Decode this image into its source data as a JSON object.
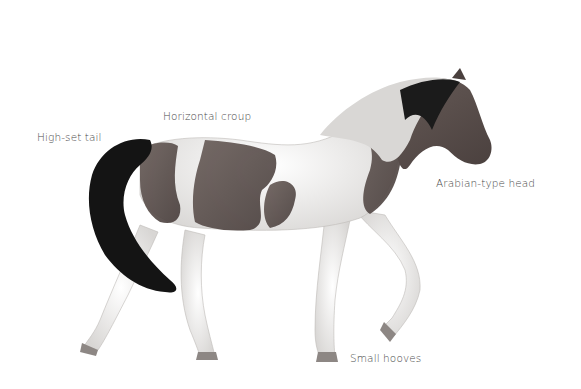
{
  "illustration": {
    "subject": "Pinto horse, side view, walking",
    "colors": {
      "dark_coat": "#5a4f4c",
      "white_coat": "#f2f2f0",
      "tail_mane": "#141414"
    }
  },
  "labels": {
    "tail": "High-set tail",
    "croup": "Horizontal croup",
    "head": "Arabian-type head",
    "hooves": "Small hooves"
  }
}
